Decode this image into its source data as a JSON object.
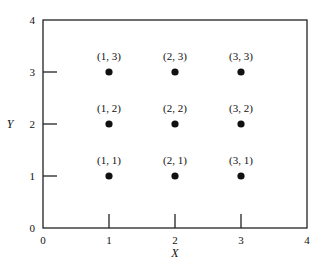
{
  "chart_data": {
    "type": "scatter",
    "title": "",
    "xlabel": "X",
    "ylabel": "Y",
    "xlim": [
      0,
      4
    ],
    "ylim": [
      0,
      4
    ],
    "grid": false,
    "x_ticks": [
      "0",
      "1",
      "2",
      "3",
      "4"
    ],
    "y_ticks": [
      "0",
      "1",
      "2",
      "3",
      "4"
    ],
    "points": [
      {
        "x": 1,
        "y": 1,
        "label": "(1, 1)"
      },
      {
        "x": 2,
        "y": 1,
        "label": "(2, 1)"
      },
      {
        "x": 3,
        "y": 1,
        "label": "(3, 1)"
      },
      {
        "x": 1,
        "y": 2,
        "label": "(1, 2)"
      },
      {
        "x": 2,
        "y": 2,
        "label": "(2, 2)"
      },
      {
        "x": 3,
        "y": 2,
        "label": "(3, 2)"
      },
      {
        "x": 1,
        "y": 3,
        "label": "(1, 3)"
      },
      {
        "x": 2,
        "y": 3,
        "label": "(2, 3)"
      },
      {
        "x": 3,
        "y": 3,
        "label": "(3, 3)"
      }
    ]
  }
}
